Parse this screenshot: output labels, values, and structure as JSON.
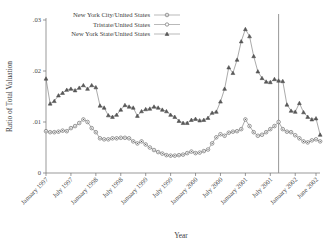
{
  "chart_data": {
    "type": "line",
    "title": "",
    "xlabel": "Year",
    "ylabel": "Ratio of Total Valuation",
    "ylim": [
      0,
      0.03
    ],
    "yticks": [
      0,
      0.01,
      0.02,
      0.03
    ],
    "ytick_labels": [
      "0",
      ".01",
      ".02",
      ".03"
    ],
    "grid": false,
    "legend_position": "top-center",
    "xtick_labels": [
      "January 1997",
      "July 1997",
      "January 1998",
      "July 1998",
      "January 1999",
      "July 1999",
      "January 2000",
      "July 2000",
      "January 2001",
      "July 2001",
      "January 2002",
      "June 2002"
    ],
    "xtick_index": [
      0,
      6,
      12,
      18,
      24,
      30,
      36,
      42,
      48,
      54,
      60,
      65
    ],
    "x_count": 66,
    "annotations": [
      {
        "name": "september-2001-reference-line",
        "type": "vline",
        "x_index": 56,
        "label": ""
      }
    ],
    "series": [
      {
        "name": "New York City/United States",
        "marker": "circle-dot",
        "color": "#6b6b6b",
        "values": [
          0.0082,
          0.008,
          0.008,
          0.0081,
          0.0083,
          0.0082,
          0.0088,
          0.0092,
          0.0098,
          0.0105,
          0.01,
          0.0088,
          0.008,
          0.0068,
          0.0066,
          0.0066,
          0.0068,
          0.0068,
          0.0069,
          0.0069,
          0.0068,
          0.0062,
          0.0058,
          0.0062,
          0.0056,
          0.005,
          0.0045,
          0.0041,
          0.0038,
          0.0035,
          0.0034,
          0.0034,
          0.0035,
          0.0036,
          0.0039,
          0.0042,
          0.0039,
          0.004,
          0.0043,
          0.0046,
          0.0058,
          0.007,
          0.0076,
          0.0073,
          0.0079,
          0.0081,
          0.0082,
          0.0086,
          0.0105,
          0.0092,
          0.008,
          0.0073,
          0.0075,
          0.008,
          0.0086,
          0.0092,
          0.01,
          0.0086,
          0.0081,
          0.008,
          0.0074,
          0.0068,
          0.0062,
          0.006,
          0.0064,
          0.0066,
          0.0062
        ]
      },
      {
        "name": "Tristate/United States",
        "marker": "circle-open",
        "color": "#8c8c8c",
        "values": []
      },
      {
        "name": "New York State/United States",
        "marker": "triangle",
        "color": "#4d4d4d",
        "values": [
          0.0185,
          0.0136,
          0.0141,
          0.0152,
          0.0157,
          0.0163,
          0.0165,
          0.0162,
          0.0167,
          0.0172,
          0.0165,
          0.0172,
          0.0168,
          0.0132,
          0.0128,
          0.0113,
          0.011,
          0.0114,
          0.0124,
          0.0133,
          0.013,
          0.0128,
          0.0112,
          0.0121,
          0.0125,
          0.0126,
          0.013,
          0.0128,
          0.0124,
          0.0121,
          0.0114,
          0.011,
          0.0102,
          0.0098,
          0.0098,
          0.0104,
          0.0106,
          0.0103,
          0.0104,
          0.0108,
          0.0118,
          0.012,
          0.014,
          0.0165,
          0.0207,
          0.0196,
          0.0222,
          0.0258,
          0.0282,
          0.0268,
          0.0229,
          0.0199,
          0.0186,
          0.0179,
          0.0178,
          0.0184,
          0.0181,
          0.018,
          0.0134,
          0.0122,
          0.012,
          0.0137,
          0.0119,
          0.011,
          0.0105,
          0.0107,
          0.0075
        ]
      }
    ]
  },
  "legend": {
    "entries": [
      {
        "label": "New York City/United States",
        "marker": "circle-dot"
      },
      {
        "label": "Tristate/United States",
        "marker": "circle-open"
      },
      {
        "label": "New York State/United States",
        "marker": "triangle"
      }
    ]
  }
}
